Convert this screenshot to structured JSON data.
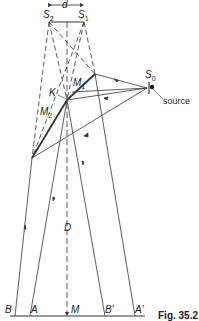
{
  "figure": {
    "caption": "Fig. 35.2",
    "labels": {
      "d": "d",
      "S2": "S",
      "S2_sub": "2",
      "S1": "S",
      "S1_sub": "1",
      "S0": "S",
      "S0_sub": "0",
      "source": "source",
      "K": "K",
      "M1": "M",
      "M1_sub": "1",
      "M2": "M",
      "M2_sub": "2",
      "D": "D",
      "B": "B",
      "A": "A",
      "M": "M",
      "Bp": "B′",
      "Ap": "A′"
    },
    "colors": {
      "line": "#333333",
      "background": "#ffffff"
    }
  }
}
